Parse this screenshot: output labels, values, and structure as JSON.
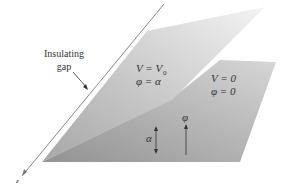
{
  "diagram": {
    "labels": {
      "gap_line1": "Insulating",
      "gap_line2": "gap",
      "upper_plane_V": "V = V",
      "upper_plane_V_sub": "0",
      "upper_plane_phi": "φ = α",
      "lower_plane_V": "V = 0",
      "lower_plane_phi": "φ = 0",
      "alpha_angle": "α",
      "phi_angle": "φ",
      "z_axis": "z"
    },
    "colors": {
      "upper_plane_light": "#f2f2f2",
      "upper_plane_dark": "#a8a8a8",
      "lower_plane_light": "#c8c8c8",
      "lower_plane_dark": "#9a9a9a",
      "axis": "#666666",
      "text": "#333333"
    }
  }
}
